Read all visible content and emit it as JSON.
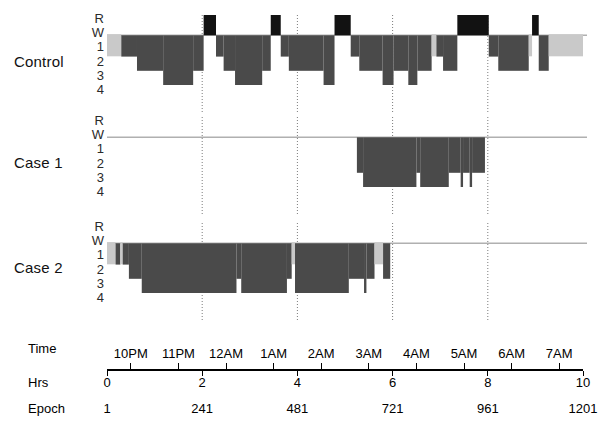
{
  "figure": {
    "colors": {
      "sleep_fill": "#4a4a4a",
      "rem_fill": "#121212",
      "wake_fill": "#c9c9c9",
      "baseline": "#b0b0b0",
      "gridline": "#7b7b7b",
      "axis": "#000000",
      "text": "#111111"
    }
  },
  "subjects": [
    {
      "name": "Control"
    },
    {
      "name": "Case 1"
    },
    {
      "name": "Case 2"
    }
  ],
  "stage_axis": {
    "labels": [
      "R",
      "W",
      "1",
      "2",
      "3",
      "4"
    ],
    "description": "Sleep stage: R = REM, W = Wake, 1-4 = NREM stages"
  },
  "axes": {
    "time": {
      "row_label": "Time",
      "ticks": [
        "10PM",
        "11PM",
        "12AM",
        "1AM",
        "2AM",
        "3AM",
        "4AM",
        "5AM",
        "6AM",
        "7AM"
      ],
      "tick_hours": [
        0.5,
        1.5,
        2.5,
        3.5,
        4.5,
        5.5,
        6.5,
        7.5,
        8.5,
        9.5
      ]
    },
    "hours": {
      "row_label": "Hrs",
      "ticks": [
        "0",
        "2",
        "4",
        "6",
        "8",
        "10"
      ],
      "tick_hours": [
        0,
        2,
        4,
        6,
        8,
        10
      ]
    },
    "epoch": {
      "row_label": "Epoch",
      "ticks": [
        "1",
        "241",
        "481",
        "721",
        "961",
        "1201"
      ],
      "tick_hours": [
        0,
        2,
        4,
        6,
        8,
        10
      ]
    },
    "range_hours": [
      0,
      10
    ],
    "gridlines_hours": [
      2,
      4,
      6,
      8
    ]
  },
  "chart_data": {
    "type": "area",
    "xlabel": "Time / Hrs / Epoch",
    "ylabel": "Sleep stage",
    "xlim": [
      0,
      10
    ],
    "ylim": [
      "R",
      "4"
    ],
    "grid": true,
    "legend": "none",
    "stage_levels": {
      "R": 0,
      "W": 1,
      "1": 2,
      "2": 3,
      "3": 4,
      "4": 5
    },
    "series": [
      {
        "name": "Control",
        "segments": [
          {
            "stage": "W",
            "start_hr": 0.0,
            "end_hr": 0.3
          },
          {
            "stage": "1",
            "start_hr": 0.3,
            "end_hr": 0.63
          },
          {
            "stage": "2",
            "start_hr": 0.63,
            "end_hr": 1.18
          },
          {
            "stage": "3",
            "start_hr": 1.18,
            "end_hr": 1.81
          },
          {
            "stage": "2",
            "start_hr": 1.81,
            "end_hr": 2.03
          },
          {
            "stage": "R",
            "start_hr": 2.03,
            "end_hr": 2.29
          },
          {
            "stage": "1",
            "start_hr": 2.29,
            "end_hr": 2.45
          },
          {
            "stage": "2",
            "start_hr": 2.45,
            "end_hr": 2.69
          },
          {
            "stage": "3",
            "start_hr": 2.69,
            "end_hr": 3.26
          },
          {
            "stage": "2",
            "start_hr": 3.26,
            "end_hr": 3.44
          },
          {
            "stage": "R",
            "start_hr": 3.44,
            "end_hr": 3.65
          },
          {
            "stage": "1",
            "start_hr": 3.65,
            "end_hr": 3.82
          },
          {
            "stage": "2",
            "start_hr": 3.82,
            "end_hr": 4.55
          },
          {
            "stage": "3",
            "start_hr": 4.55,
            "end_hr": 4.78
          },
          {
            "stage": "R",
            "start_hr": 4.78,
            "end_hr": 5.12
          },
          {
            "stage": "1",
            "start_hr": 5.12,
            "end_hr": 5.3
          },
          {
            "stage": "2",
            "start_hr": 5.3,
            "end_hr": 5.79
          },
          {
            "stage": "3",
            "start_hr": 5.79,
            "end_hr": 6.02
          },
          {
            "stage": "2",
            "start_hr": 6.02,
            "end_hr": 6.33
          },
          {
            "stage": "3",
            "start_hr": 6.33,
            "end_hr": 6.52
          },
          {
            "stage": "2",
            "start_hr": 6.52,
            "end_hr": 6.82
          },
          {
            "stage": "W",
            "start_hr": 6.82,
            "end_hr": 6.92
          },
          {
            "stage": "1",
            "start_hr": 6.92,
            "end_hr": 7.06
          },
          {
            "stage": "2",
            "start_hr": 7.06,
            "end_hr": 7.36
          },
          {
            "stage": "R",
            "start_hr": 7.36,
            "end_hr": 8.02
          },
          {
            "stage": "1",
            "start_hr": 8.02,
            "end_hr": 8.22
          },
          {
            "stage": "2",
            "start_hr": 8.22,
            "end_hr": 8.86
          },
          {
            "stage": "W",
            "start_hr": 8.86,
            "end_hr": 8.93
          },
          {
            "stage": "R",
            "start_hr": 8.93,
            "end_hr": 9.07
          },
          {
            "stage": "2",
            "start_hr": 9.07,
            "end_hr": 9.28
          },
          {
            "stage": "W",
            "start_hr": 9.28,
            "end_hr": 10.0
          }
        ]
      },
      {
        "name": "Case 1",
        "segments": [
          {
            "stage": "W",
            "start_hr": 0.0,
            "end_hr": 5.25
          },
          {
            "stage": "2",
            "start_hr": 5.25,
            "end_hr": 5.38
          },
          {
            "stage": "3",
            "start_hr": 5.38,
            "end_hr": 6.5
          },
          {
            "stage": "2",
            "start_hr": 6.5,
            "end_hr": 6.58
          },
          {
            "stage": "3",
            "start_hr": 6.58,
            "end_hr": 7.18
          },
          {
            "stage": "2",
            "start_hr": 7.18,
            "end_hr": 7.43
          },
          {
            "stage": "3",
            "start_hr": 7.43,
            "end_hr": 7.48
          },
          {
            "stage": "2",
            "start_hr": 7.48,
            "end_hr": 7.62
          },
          {
            "stage": "3",
            "start_hr": 7.62,
            "end_hr": 7.67
          },
          {
            "stage": "2",
            "start_hr": 7.67,
            "end_hr": 7.94
          },
          {
            "stage": "W",
            "start_hr": 7.94,
            "end_hr": 10.0
          }
        ]
      },
      {
        "name": "Case 2",
        "segments": [
          {
            "stage": "W",
            "start_hr": 0.0,
            "end_hr": 0.18
          },
          {
            "stage": "1",
            "start_hr": 0.18,
            "end_hr": 0.28
          },
          {
            "stage": "W",
            "start_hr": 0.28,
            "end_hr": 0.33
          },
          {
            "stage": "1",
            "start_hr": 0.33,
            "end_hr": 0.46
          },
          {
            "stage": "2",
            "start_hr": 0.46,
            "end_hr": 0.73
          },
          {
            "stage": "3",
            "start_hr": 0.73,
            "end_hr": 2.72
          },
          {
            "stage": "2",
            "start_hr": 2.72,
            "end_hr": 2.82
          },
          {
            "stage": "3",
            "start_hr": 2.82,
            "end_hr": 3.78
          },
          {
            "stage": "2",
            "start_hr": 3.78,
            "end_hr": 3.88
          },
          {
            "stage": "W",
            "start_hr": 3.88,
            "end_hr": 3.95
          },
          {
            "stage": "3",
            "start_hr": 3.95,
            "end_hr": 5.08
          },
          {
            "stage": "2",
            "start_hr": 5.08,
            "end_hr": 5.4
          },
          {
            "stage": "3",
            "start_hr": 5.4,
            "end_hr": 5.45
          },
          {
            "stage": "2",
            "start_hr": 5.45,
            "end_hr": 5.62
          },
          {
            "stage": "W",
            "start_hr": 5.62,
            "end_hr": 5.8
          },
          {
            "stage": "2",
            "start_hr": 5.8,
            "end_hr": 5.95
          },
          {
            "stage": "W",
            "start_hr": 5.95,
            "end_hr": 10.0
          }
        ]
      }
    ]
  }
}
